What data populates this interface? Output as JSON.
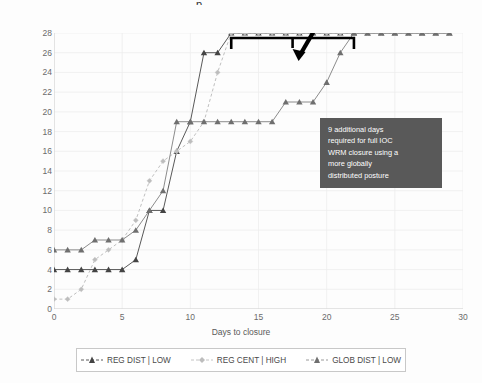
{
  "title_remnant": "p",
  "axis": {
    "x_title": "Days to closure",
    "y_title": "Number of bases closed",
    "x_ticks": [
      "0",
      "5",
      "10",
      "15",
      "20",
      "25",
      "30"
    ],
    "y_ticks": [
      "0",
      "2",
      "4",
      "6",
      "8",
      "10",
      "12",
      "14",
      "16",
      "18",
      "20",
      "22",
      "24",
      "26",
      "28"
    ]
  },
  "legend": {
    "items": [
      {
        "label": "REG DIST | LOW",
        "color": "#595959",
        "marker": "triangle",
        "dash": "none"
      },
      {
        "label": "REG CENT | HIGH",
        "color": "#bfbfbf",
        "marker": "diamond",
        "dash": "dashed"
      },
      {
        "label": "GLOB DIST | LOW",
        "color": "#8c8c8c",
        "marker": "triangle",
        "dash": "none"
      }
    ]
  },
  "annotation": {
    "text": "9 additional days required for full IOC WRM closure using a more globally distributed posture",
    "lines": [
      "9 additional days",
      "required for full IOC",
      "WRM closure using a",
      "more globally",
      "distributed posture"
    ],
    "box_color": "#595959",
    "text_color": "#ffffff",
    "bracket_span_days": [
      13,
      22
    ],
    "bracket_label_days": 9
  },
  "chart_data": {
    "type": "line",
    "title": "",
    "xlabel": "Days to closure",
    "ylabel": "Number of bases closed",
    "xlim": [
      0,
      30
    ],
    "ylim": [
      0,
      28
    ],
    "xticks": [
      0,
      5,
      10,
      15,
      20,
      25,
      30
    ],
    "yticks": [
      0,
      2,
      4,
      6,
      8,
      10,
      12,
      14,
      16,
      18,
      20,
      22,
      24,
      26,
      28
    ],
    "grid": true,
    "legend_position": "bottom",
    "series": [
      {
        "name": "REG DIST | LOW",
        "color": "#595959",
        "marker": "triangle",
        "dash": "none",
        "x": [
          0,
          1,
          2,
          3,
          4,
          5,
          6,
          7,
          8,
          9,
          10,
          11,
          12,
          13,
          14,
          15,
          16,
          17,
          18,
          19,
          20,
          21,
          22,
          23,
          24,
          25,
          26,
          27,
          28,
          29
        ],
        "values": [
          4,
          4,
          4,
          4,
          4,
          4,
          5,
          10,
          10,
          16,
          19,
          26,
          26,
          28,
          28,
          28,
          28,
          28,
          28,
          28,
          28,
          28,
          28,
          28,
          28,
          28,
          28,
          28,
          28,
          28
        ]
      },
      {
        "name": "REG CENT | HIGH",
        "color": "#bfbfbf",
        "marker": "diamond",
        "dash": "dashed",
        "x": [
          0,
          1,
          2,
          3,
          4,
          5,
          6,
          7,
          8,
          9,
          10,
          11,
          12,
          13,
          14,
          15,
          16,
          17,
          18,
          19,
          20,
          21,
          22,
          23,
          24,
          25,
          26,
          27,
          28,
          29
        ],
        "values": [
          1,
          1,
          2,
          5,
          6,
          7,
          9,
          13,
          15,
          16,
          17,
          19,
          24,
          28,
          28,
          28,
          28,
          28,
          28,
          28,
          28,
          28,
          28,
          28,
          28,
          28,
          28,
          28,
          28,
          28
        ]
      },
      {
        "name": "GLOB DIST | LOW",
        "color": "#8c8c8c",
        "marker": "triangle",
        "dash": "none",
        "x": [
          0,
          1,
          2,
          3,
          4,
          5,
          6,
          7,
          8,
          9,
          10,
          11,
          12,
          13,
          14,
          15,
          16,
          17,
          18,
          19,
          20,
          21,
          22,
          23,
          24,
          25,
          26,
          27,
          28,
          29
        ],
        "values": [
          6,
          6,
          6,
          7,
          7,
          7,
          8,
          10,
          12,
          19,
          19,
          19,
          19,
          19,
          19,
          19,
          19,
          21,
          21,
          21,
          23,
          26,
          28,
          28,
          28,
          28,
          28,
          28,
          28,
          28
        ]
      }
    ]
  }
}
